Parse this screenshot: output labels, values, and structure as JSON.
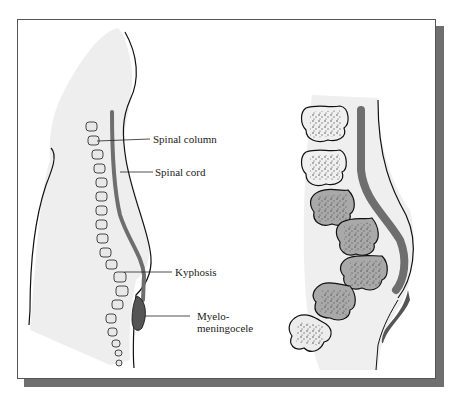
{
  "figure": {
    "left_panel": {
      "description": "Sagittal view of infant torso showing spine with kyphosis and myelomeningocele",
      "labels": [
        {
          "id": "spinal-column",
          "text": "Spinal column"
        },
        {
          "id": "spinal-cord",
          "text": "Spinal cord"
        },
        {
          "id": "kyphosis",
          "text": "Kyphosis"
        },
        {
          "id": "myelomeningocele",
          "line1": "Myelo-",
          "line2": "meningocele"
        }
      ]
    },
    "right_panel": {
      "description": "Enlarged view of lower vertebrae and spinal cord with myelomeningocele sac"
    },
    "colors": {
      "body_fill": "#eeeeee",
      "cord": "#6e6e6e",
      "vertebra_light": "#efefef",
      "vertebra_dark": "#a9a9a9",
      "frame_shadow": "#6f6f6f",
      "outline": "#111111"
    }
  }
}
